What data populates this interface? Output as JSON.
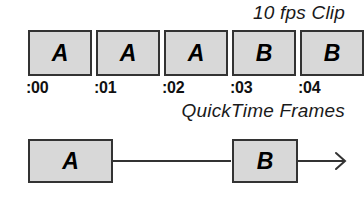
{
  "figure": {
    "clip_title": "10 fps Clip",
    "frames_title": "QuickTime Frames",
    "filmstrip": {
      "frames": [
        {
          "letter": "A",
          "time": ":00"
        },
        {
          "letter": "A",
          "time": ":01"
        },
        {
          "letter": "A",
          "time": ":02"
        },
        {
          "letter": "B",
          "time": ":03"
        },
        {
          "letter": "B",
          "time": ":04"
        }
      ]
    },
    "flow": {
      "nodes": [
        {
          "letter": "A"
        },
        {
          "letter": "B"
        }
      ],
      "connector_icon": "arrow-right-icon",
      "trailing_icon": "arrow-right-icon"
    },
    "colors": {
      "frame_fill": "#d8d8d8",
      "frame_border": "#333333",
      "text": "#111111",
      "background": "#ffffff"
    }
  }
}
